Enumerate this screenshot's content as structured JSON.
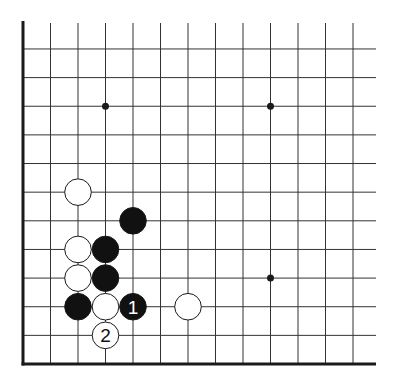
{
  "diagram": {
    "type": "go-board-fragment",
    "visible_columns": 13,
    "visible_rows": 13,
    "edges": [
      "left",
      "bottom"
    ],
    "star_points": [
      {
        "col": 3,
        "row": 3
      },
      {
        "col": 9,
        "row": 3
      },
      {
        "col": 9,
        "row": 9
      }
    ],
    "stones": [
      {
        "color": "white",
        "col": 2,
        "row": 6,
        "label": ""
      },
      {
        "color": "black",
        "col": 4,
        "row": 7,
        "label": ""
      },
      {
        "color": "white",
        "col": 2,
        "row": 8,
        "label": ""
      },
      {
        "color": "black",
        "col": 3,
        "row": 8,
        "label": ""
      },
      {
        "color": "white",
        "col": 2,
        "row": 9,
        "label": ""
      },
      {
        "color": "black",
        "col": 3,
        "row": 9,
        "label": ""
      },
      {
        "color": "black",
        "col": 2,
        "row": 10,
        "label": ""
      },
      {
        "color": "white",
        "col": 3,
        "row": 10,
        "label": ""
      },
      {
        "color": "black",
        "col": 4,
        "row": 10,
        "label": "1"
      },
      {
        "color": "white",
        "col": 6,
        "row": 10,
        "label": ""
      },
      {
        "color": "white",
        "col": 3,
        "row": 11,
        "label": "2"
      }
    ],
    "colors": {
      "line": "#333333",
      "edge": "#1a1a1a",
      "black_stone": "#111111",
      "white_stone": "#ffffff",
      "background": "#ffffff"
    }
  }
}
